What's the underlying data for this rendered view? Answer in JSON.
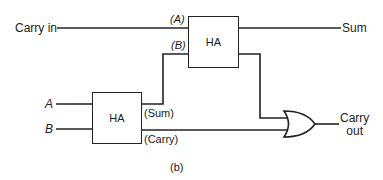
{
  "diagram": {
    "type": "full-adder-from-half-adders",
    "caption": "(b)",
    "blocks": [
      {
        "id": "ha_top",
        "label": "HA",
        "inputs": [
          "(A)",
          "(B)"
        ]
      },
      {
        "id": "ha_bottom",
        "label": "HA",
        "outputs": [
          "(Sum)",
          "(Carry)"
        ]
      }
    ],
    "gate": {
      "id": "or_gate",
      "type": "OR"
    },
    "labels": {
      "carry_in": "Carry in",
      "sum": "Sum",
      "input_a_top": "(A)",
      "input_b_top": "(B)",
      "input_a": "A",
      "input_b": "B",
      "ha_top": "HA",
      "ha_bottom": "HA",
      "sum_out_bottom": "(Sum)",
      "carry_out_bottom": "(Carry)",
      "carry_out_line1": "Carry",
      "carry_out_line2": "out",
      "caption": "(b)"
    },
    "connections": [
      {
        "from": "Carry in",
        "to": "ha_top.(A)"
      },
      {
        "from": "ha_bottom.(Sum)",
        "to": "ha_top.(B)"
      },
      {
        "from": "ha_top.sum",
        "to": "Sum"
      },
      {
        "from": "ha_top.carry",
        "to": "or_gate.in1"
      },
      {
        "from": "ha_bottom.(Carry)",
        "to": "or_gate.in2"
      },
      {
        "from": "A",
        "to": "ha_bottom.in1"
      },
      {
        "from": "B",
        "to": "ha_bottom.in2"
      },
      {
        "from": "or_gate.out",
        "to": "Carry out"
      }
    ],
    "colors": {
      "ink": "#222222",
      "background": "#ffffff"
    }
  }
}
